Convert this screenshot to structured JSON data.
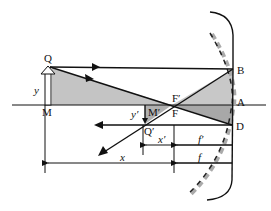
{
  "diagram": {
    "type": "concave-mirror-ray-diagram",
    "colors": {
      "line": "#111111",
      "shade_upper": "#c4c4c4",
      "shade_lower": "#a8a8a8",
      "dashed_gray": "#999999"
    },
    "points": {
      "Q": "Q",
      "M": "M",
      "B": "B",
      "A": "A",
      "D": "D",
      "F_prime": "F′",
      "F": "F",
      "M_prime": "M′",
      "Q_prime": "Q′"
    },
    "distances": {
      "y": "y",
      "y_prime": "y′",
      "x": "x",
      "x_prime": "x′",
      "f": "f",
      "f_prime": "f′"
    }
  }
}
